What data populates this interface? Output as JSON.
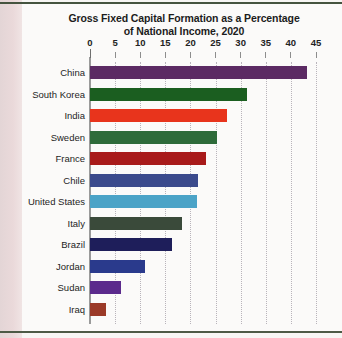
{
  "page": {
    "background_color": "#fbfaf9",
    "margin_color": "#e8dcdc",
    "rule_color": "#45543f"
  },
  "chart_data": {
    "type": "bar",
    "orientation": "horizontal",
    "title": "Gross Fixed Capital Formation as a Percentage of National Income, 2020",
    "title_line1": "Gross Fixed Capital Formation as a Percentage",
    "title_line2": "of National Income, 2020",
    "xlabel": "",
    "ylabel": "",
    "xlim": [
      0,
      45
    ],
    "tick_step": 5,
    "tick_labels": [
      "0",
      "5",
      "10",
      "15",
      "20",
      "25",
      "30",
      "35",
      "40",
      "45"
    ],
    "tick_values": [
      0,
      5,
      10,
      15,
      20,
      25,
      30,
      35,
      40,
      45
    ],
    "grid": "vertical-dotted",
    "legend": "none",
    "categories": [
      "China",
      "South Korea",
      "India",
      "Sweden",
      "France",
      "Chile",
      "United States",
      "Italy",
      "Brazil",
      "Jordan",
      "Sudan",
      "Iraq"
    ],
    "values": [
      43.2,
      31.2,
      27.2,
      25.3,
      23.1,
      21.5,
      21.3,
      18.4,
      16.4,
      10.9,
      6.2,
      3.2
    ],
    "colors": [
      "#5B2A63",
      "#1B5E20",
      "#E8341C",
      "#2E6B3A",
      "#A81A1A",
      "#3B4A8C",
      "#4BA3C7",
      "#3A4A3A",
      "#1E1E5A",
      "#2A3A8C",
      "#5B2A8C",
      "#9B3A28"
    ],
    "bars": [
      {
        "label": "China",
        "value": 43.2,
        "color": "#5B2A63"
      },
      {
        "label": "South Korea",
        "value": 31.2,
        "color": "#1B5E20"
      },
      {
        "label": "India",
        "value": 27.2,
        "color": "#E8341C"
      },
      {
        "label": "Sweden",
        "value": 25.3,
        "color": "#2E6B3A"
      },
      {
        "label": "France",
        "value": 23.1,
        "color": "#A81A1A"
      },
      {
        "label": "Chile",
        "value": 21.5,
        "color": "#3B4A8C"
      },
      {
        "label": "United States",
        "value": 21.3,
        "color": "#4BA3C7"
      },
      {
        "label": "Italy",
        "value": 18.4,
        "color": "#3A4A3A"
      },
      {
        "label": "Brazil",
        "value": 16.4,
        "color": "#1E1E5A"
      },
      {
        "label": "Jordan",
        "value": 10.9,
        "color": "#2A3A8C"
      },
      {
        "label": "Sudan",
        "value": 6.2,
        "color": "#5B2A8C"
      },
      {
        "label": "Iraq",
        "value": 3.2,
        "color": "#9B3A28"
      }
    ]
  }
}
